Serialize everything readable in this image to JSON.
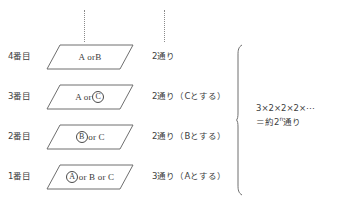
{
  "diagram": {
    "title_present": false,
    "rows": [
      {
        "order_label": "4番目",
        "box_prefix": "A or ",
        "box_letter": "B",
        "box_letter_circled": false,
        "box_suffix": "",
        "box_text_full": "A or B",
        "count_text": "2通り"
      },
      {
        "order_label": "3番目",
        "box_prefix": "A or ",
        "box_letter": "C",
        "box_letter_circled": true,
        "box_suffix": "",
        "box_text_full": "A or Ⓒ",
        "count_text": "2通り（Cとする）"
      },
      {
        "order_label": "2番目",
        "box_prefix": "",
        "box_letter": "B",
        "box_letter_circled": true,
        "box_suffix": " or C",
        "box_text_full": "Ⓑ or C",
        "count_text": "2通り（Bとする）"
      },
      {
        "order_label": "1番目",
        "box_prefix": "",
        "box_letter": "A",
        "box_letter_circled": true,
        "box_suffix": " or B or C",
        "box_text_full": "Ⓐ or B or C",
        "count_text": "3通り（Aとする）"
      }
    ],
    "formula": {
      "line1": "3×2×2×2×⋯",
      "line2_prefix": "＝約2",
      "line2_exponent": "n",
      "line2_suffix": "通り",
      "line2_full": "＝約2ⁿ通り"
    },
    "colors": {
      "ink": "#3a3a3a",
      "line": "#6f6f6f",
      "background": "#ffffff"
    }
  }
}
